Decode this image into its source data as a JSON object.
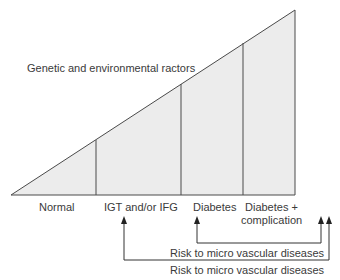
{
  "title_text": "Genetic and environmental ractors",
  "stages": [
    {
      "label": "Normal"
    },
    {
      "label": "IGT and/or IFG"
    },
    {
      "label": "Diabetes"
    },
    {
      "label": "Diabetes +",
      "label2": "complication"
    }
  ],
  "arrows": [
    {
      "label": "Risk to micro vascular diseases"
    },
    {
      "label": "Risk to micro vascular diseases"
    }
  ],
  "colors": {
    "fill": "#ececec",
    "stroke": "#4a4a4a"
  }
}
